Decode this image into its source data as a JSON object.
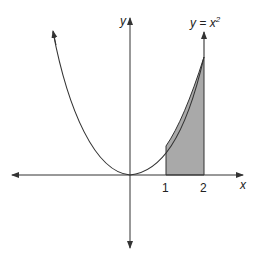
{
  "figure": {
    "function_label": "y = x",
    "function_exponent": "2",
    "x_axis_label": "x",
    "y_axis_label": "y",
    "ticks": [
      {
        "value": 1,
        "label": "1"
      },
      {
        "value": 2,
        "label": "2"
      }
    ],
    "shaded_region": {
      "from": 1,
      "to": 2,
      "description": "area under y = x^2 from x = 1 to x = 2"
    },
    "colors": {
      "line": "#333333",
      "shade": "#a9a9a9"
    }
  }
}
